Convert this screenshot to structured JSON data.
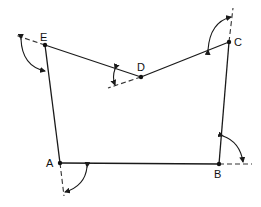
{
  "diagram": {
    "type": "polygon-deflection-angles",
    "vertices": [
      {
        "id": "A",
        "label": "A",
        "x": 60,
        "y": 163,
        "label_x": 46,
        "label_y": 167
      },
      {
        "id": "B",
        "label": "B",
        "x": 219,
        "y": 164,
        "label_x": 214,
        "label_y": 178
      },
      {
        "id": "C",
        "label": "C",
        "x": 229,
        "y": 42,
        "label_x": 234,
        "label_y": 46
      },
      {
        "id": "D",
        "label": "D",
        "x": 141,
        "y": 77,
        "label_x": 137,
        "label_y": 71
      },
      {
        "id": "E",
        "label": "E",
        "x": 45,
        "y": 45,
        "label_x": 40,
        "label_y": 41
      }
    ],
    "edges": [
      [
        "A",
        "B"
      ],
      [
        "B",
        "C"
      ],
      [
        "C",
        "D"
      ],
      [
        "D",
        "E"
      ],
      [
        "E",
        "A"
      ]
    ],
    "colors": {
      "line": "#1a1a1a",
      "background": "#ffffff"
    }
  }
}
